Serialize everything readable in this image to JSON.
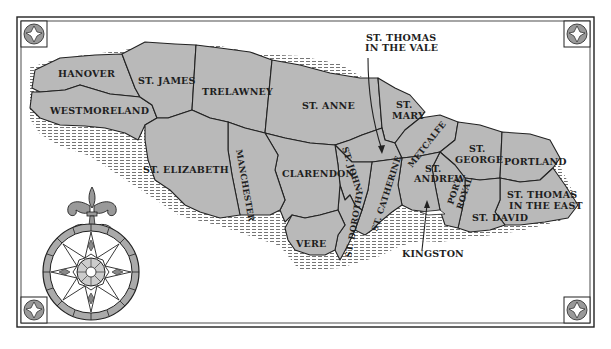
{
  "map": {
    "title": "Parishes of Jamaica",
    "colors": {
      "land": "#b9b9b9",
      "ink": "#222222",
      "background": "#ffffff"
    },
    "parishes": [
      {
        "id": "hanover",
        "label": "HANOVER"
      },
      {
        "id": "st-james",
        "label": "ST. JAMES"
      },
      {
        "id": "trelawney",
        "label": "TRELAWNEY"
      },
      {
        "id": "westmoreland",
        "label": "WESTMORELAND"
      },
      {
        "id": "st-anne",
        "label": "ST. ANNE"
      },
      {
        "id": "st-mary",
        "label_line1": "ST.",
        "label_line2": "MARY"
      },
      {
        "id": "st-elizabeth",
        "label": "ST. ELIZABETH"
      },
      {
        "id": "manchester",
        "label": "MANCHESTER"
      },
      {
        "id": "clarendon",
        "label": "CLARENDON"
      },
      {
        "id": "st-john",
        "label": "ST. JOHN"
      },
      {
        "id": "st-catherine",
        "label": "ST. CATHERINE"
      },
      {
        "id": "metcalfe",
        "label": "METCALFE"
      },
      {
        "id": "st-andrew",
        "label_line1": "ST.",
        "label_line2": "ANDREW"
      },
      {
        "id": "port-royal",
        "label_line1": "PORT",
        "label_line2": "ROYAL"
      },
      {
        "id": "st-george",
        "label_line1": "ST.",
        "label_line2": "GEORGE"
      },
      {
        "id": "portland",
        "label": "PORTLAND"
      },
      {
        "id": "st-thomas-in-the-east",
        "label_line1": "ST. THOMAS",
        "label_line2": "IN THE EAST"
      },
      {
        "id": "st-david",
        "label": "ST. DAVID"
      },
      {
        "id": "vere",
        "label": "VERE"
      },
      {
        "id": "st-dorothy",
        "label": "ST. DOROTHY"
      }
    ],
    "callouts": [
      {
        "id": "st-thomas-in-the-vale",
        "label_line1": "ST. THOMAS",
        "label_line2": "IN THE VALE"
      },
      {
        "id": "kingston",
        "label": "KINGSTON"
      }
    ],
    "decorations": [
      "compass-rose",
      "fleur-de-lis",
      "corner-ornament-tl",
      "corner-ornament-tr",
      "corner-ornament-bl",
      "corner-ornament-br"
    ]
  }
}
